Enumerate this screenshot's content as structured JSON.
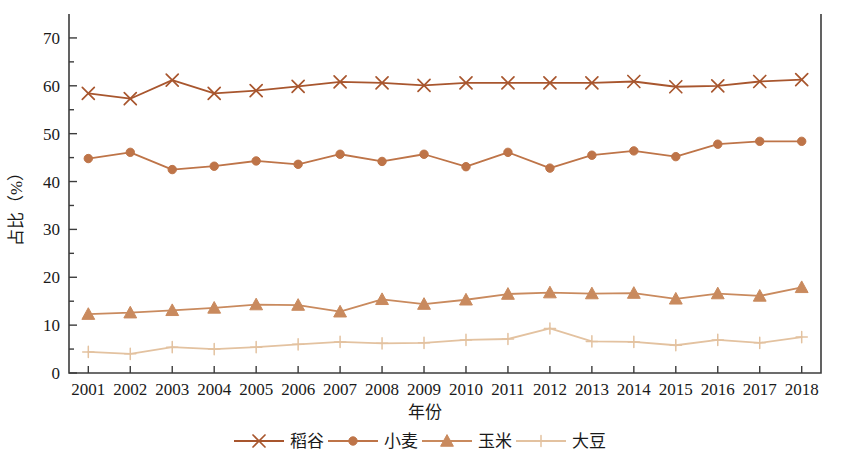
{
  "chart_data": {
    "type": "line",
    "title": "",
    "xlabel": "年份",
    "ylabel": "占比（%）",
    "ylim": [
      0,
      75
    ],
    "yticks": [
      0,
      10,
      20,
      30,
      40,
      50,
      60,
      70
    ],
    "ytick_labels": [
      "0",
      "10",
      "20",
      "30",
      "40",
      "50",
      "60",
      "70"
    ],
    "grid": false,
    "legend_position": "bottom",
    "categories": [
      "2001",
      "2002",
      "2003",
      "2004",
      "2005",
      "2006",
      "2007",
      "2008",
      "2009",
      "2010",
      "2011",
      "2012",
      "2013",
      "2014",
      "2015",
      "2016",
      "2017",
      "2018"
    ],
    "series": [
      {
        "name": "稻谷",
        "marker": "x-marker",
        "color": "#A8562E",
        "values": [
          58.4,
          57.3,
          61.2,
          58.4,
          59.0,
          59.9,
          60.8,
          60.6,
          60.1,
          60.6,
          60.6,
          60.6,
          60.6,
          60.9,
          59.8,
          60.0,
          60.9,
          61.3
        ]
      },
      {
        "name": "小麦",
        "marker": "circle-marker",
        "color": "#BE7448",
        "values": [
          44.8,
          46.1,
          42.5,
          43.2,
          44.3,
          43.6,
          45.7,
          44.2,
          45.7,
          43.1,
          46.1,
          42.8,
          45.5,
          46.4,
          45.2,
          47.8,
          48.4,
          48.4
        ]
      },
      {
        "name": "玉米",
        "marker": "triangle-marker",
        "color": "#C98A5E",
        "values": [
          12.3,
          12.6,
          13.1,
          13.6,
          14.3,
          14.2,
          12.8,
          15.4,
          14.4,
          15.3,
          16.5,
          16.8,
          16.6,
          16.7,
          15.5,
          16.6,
          16.1,
          17.9
        ]
      },
      {
        "name": "大豆",
        "marker": "plus-marker",
        "color": "#E3C2A0",
        "values": [
          4.4,
          4.0,
          5.4,
          5.0,
          5.4,
          6.0,
          6.5,
          6.2,
          6.3,
          6.9,
          7.1,
          9.3,
          6.6,
          6.5,
          5.8,
          6.9,
          6.3,
          7.5
        ]
      }
    ]
  },
  "legend": {
    "items": [
      {
        "label": "稻谷",
        "marker": "x-marker",
        "color": "#A8562E"
      },
      {
        "label": "小麦",
        "marker": "circle-marker",
        "color": "#BE7448"
      },
      {
        "label": "玉米",
        "marker": "triangle-marker",
        "color": "#C98A5E"
      },
      {
        "label": "大豆",
        "marker": "plus-marker",
        "color": "#E3C2A0"
      }
    ]
  },
  "axes": {
    "x_title": "年份",
    "y_title": "占比（%）"
  },
  "colors": {
    "axis": "#3c3c3c",
    "text": "#1a1a1a",
    "background": "#ffffff"
  }
}
